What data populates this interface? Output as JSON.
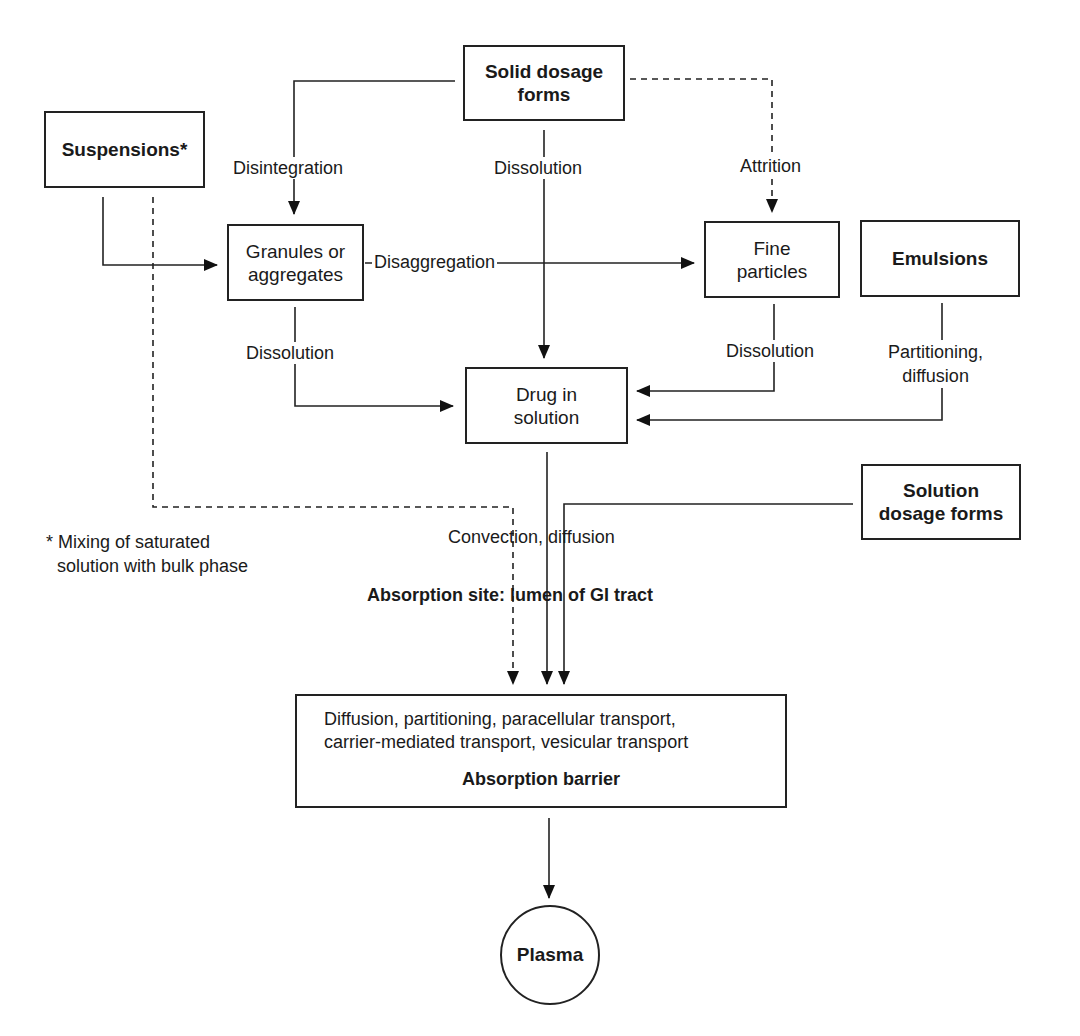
{
  "diagram": {
    "nodes": {
      "solid_dosage_forms": "Solid dosage forms",
      "suspensions": "Suspensions*",
      "granules": "Granules or aggregates",
      "fine_particles": "Fine particles",
      "emulsions": "Emulsions",
      "drug_in_solution": "Drug in solution",
      "solution_dosage_forms": "Solution dosage forms",
      "plasma": "Plasma"
    },
    "barrier": {
      "mechanisms_line1": "Diffusion, partitioning, paracellular transport,",
      "mechanisms_line2": "carrier-mediated transport, vesicular transport",
      "title": "Absorption barrier"
    },
    "edge_labels": {
      "disintegration": "Disintegration",
      "dissolution_solid": "Dissolution",
      "attrition": "Attrition",
      "disaggregation": "Disaggregation",
      "dissolution_granules": "Dissolution",
      "dissolution_fine": "Dissolution",
      "partitioning_line1": "Partitioning,",
      "partitioning_line2": "diffusion",
      "convection": "Convection, diffusion"
    },
    "region_label": "Absorption site: lumen of GI tract",
    "footnote_line1": "* Mixing of saturated",
    "footnote_line2": "solution with bulk phase",
    "edges": [
      {
        "from": "Solid dosage forms",
        "to": "Granules or aggregates",
        "label": "Disintegration",
        "style": "solid"
      },
      {
        "from": "Solid dosage forms",
        "to": "Drug in solution",
        "label": "Dissolution",
        "style": "solid"
      },
      {
        "from": "Solid dosage forms",
        "to": "Fine particles",
        "label": "Attrition",
        "style": "dashed"
      },
      {
        "from": "Suspensions*",
        "to": "Granules or aggregates",
        "label": "",
        "style": "solid"
      },
      {
        "from": "Granules or aggregates",
        "to": "Fine particles",
        "label": "Disaggregation",
        "style": "solid"
      },
      {
        "from": "Granules or aggregates",
        "to": "Drug in solution",
        "label": "Dissolution",
        "style": "solid"
      },
      {
        "from": "Fine particles",
        "to": "Drug in solution",
        "label": "Dissolution",
        "style": "solid"
      },
      {
        "from": "Emulsions",
        "to": "Drug in solution",
        "label": "Partitioning, diffusion",
        "style": "solid"
      },
      {
        "from": "Suspensions*",
        "to": "Absorption barrier",
        "label": "",
        "style": "dashed"
      },
      {
        "from": "Drug in solution",
        "to": "Absorption barrier",
        "label": "Convection, diffusion",
        "style": "solid"
      },
      {
        "from": "Solution dosage forms",
        "to": "Absorption barrier",
        "label": "",
        "style": "solid"
      },
      {
        "from": "Absorption barrier",
        "to": "Plasma",
        "label": "",
        "style": "solid"
      }
    ]
  }
}
